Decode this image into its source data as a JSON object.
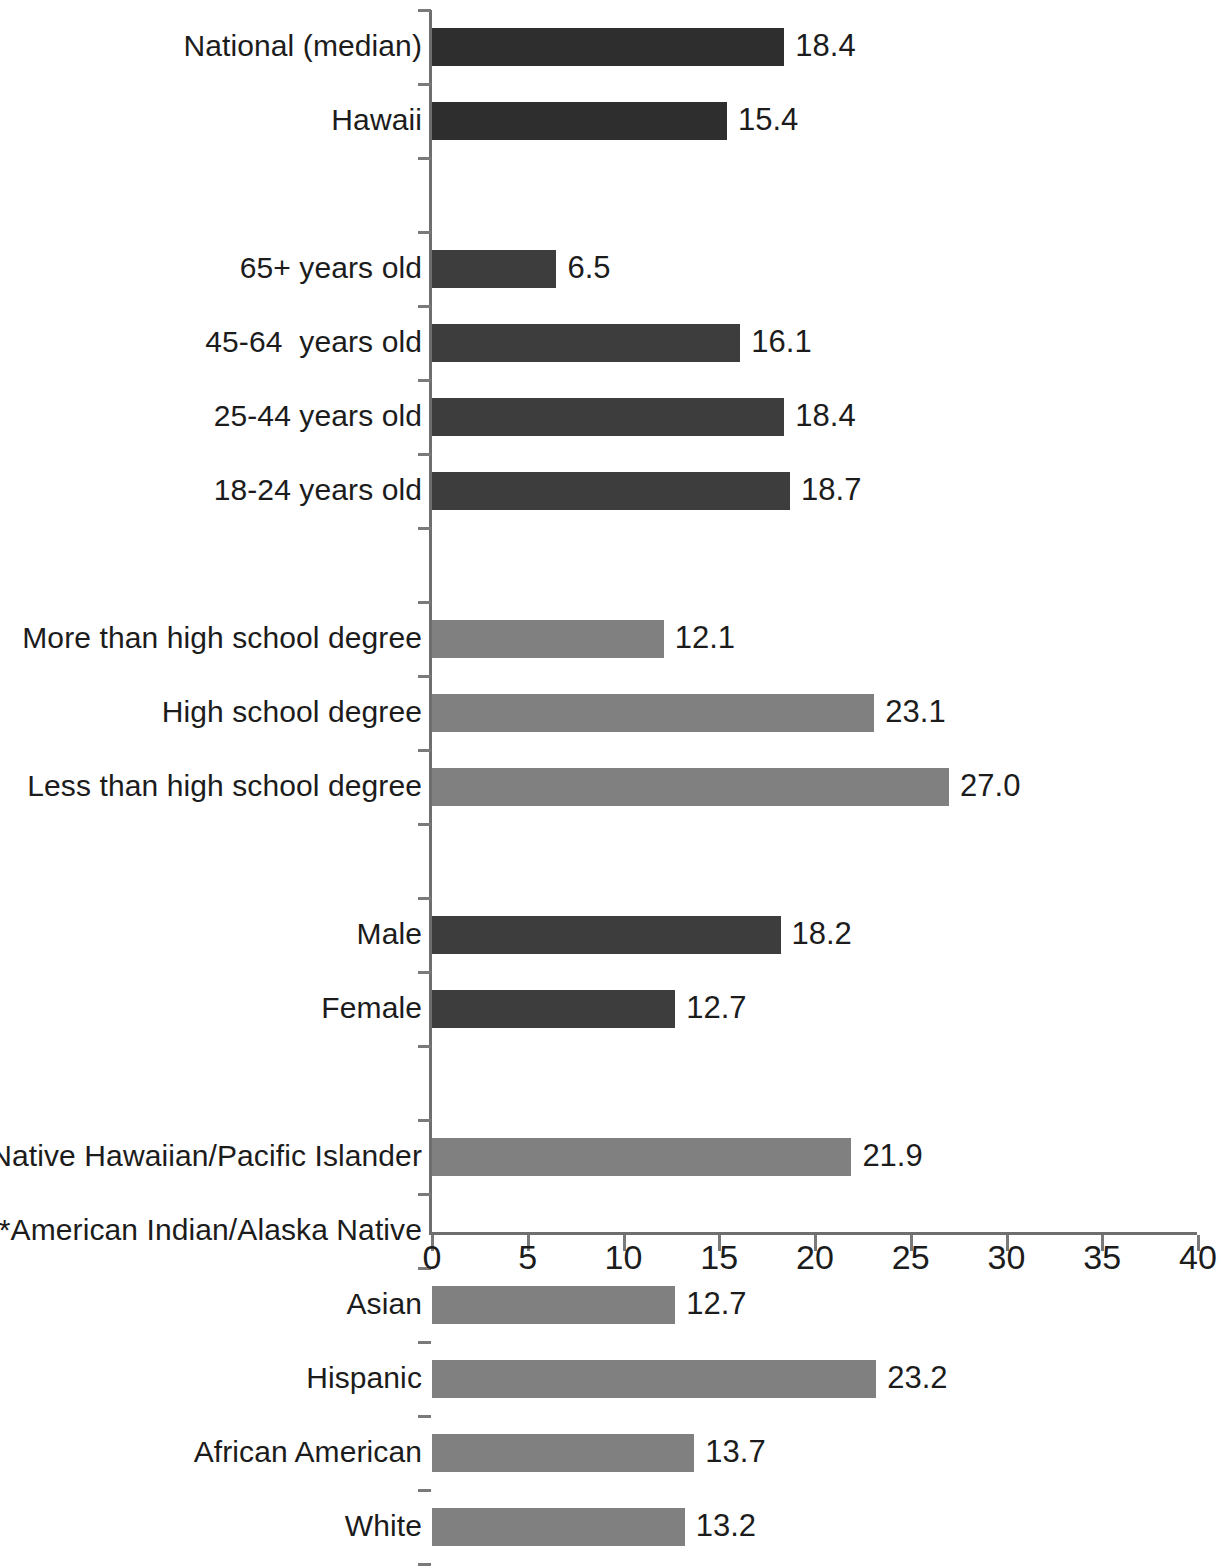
{
  "chart_data": {
    "type": "bar",
    "orientation": "horizontal",
    "title": "",
    "subtitle": "",
    "xlabel": "",
    "ylabel": "",
    "xlim": [
      0,
      40
    ],
    "xticks": [
      "0",
      "5",
      "10",
      "15",
      "20",
      "25",
      "30",
      "35",
      "40"
    ],
    "xtick_values": [
      0,
      5,
      10,
      15,
      20,
      25,
      30,
      35,
      40
    ],
    "grid": false,
    "legend": "none",
    "colors": {
      "benchmark": "#2e2e2e",
      "age": "#3d3d3d",
      "education": "#808080",
      "gender": "#3d3d3d",
      "race": "#808080",
      "axis": "#6e6e6e",
      "text": "#1c1c1c",
      "background": "#ffffff"
    },
    "note": "***American Indian/Alaska Native has no bar and no value shown",
    "categories": [
      "National (median)",
      "Hawaii",
      "",
      "65+ years old",
      "45-64  years old",
      "25-44 years old",
      "18-24 years old",
      "",
      "More than high school degree",
      "High school degree",
      "Less than high school degree",
      "",
      "Male",
      "Female",
      "",
      "Native Hawaiian/Pacific Islander",
      "***American Indian/Alaska Native",
      "Asian",
      "Hispanic",
      "African American",
      "White"
    ],
    "values": [
      18.4,
      15.4,
      null,
      6.5,
      16.1,
      18.4,
      18.7,
      null,
      12.1,
      23.1,
      27.0,
      null,
      18.2,
      12.7,
      null,
      21.9,
      null,
      12.7,
      23.2,
      13.7,
      13.2
    ],
    "rows": [
      {
        "label": "National (median)",
        "value": 18.4,
        "value_text": "18.4",
        "group": "benchmark",
        "spacer_after": false
      },
      {
        "label": "Hawaii",
        "value": 15.4,
        "value_text": "15.4",
        "group": "benchmark",
        "spacer_after": true
      },
      {
        "label": "65+ years old",
        "value": 6.5,
        "value_text": "6.5",
        "group": "age",
        "spacer_after": false
      },
      {
        "label": "45-64  years old",
        "value": 16.1,
        "value_text": "16.1",
        "group": "age",
        "spacer_after": false
      },
      {
        "label": "25-44 years old",
        "value": 18.4,
        "value_text": "18.4",
        "group": "age",
        "spacer_after": false
      },
      {
        "label": "18-24 years old",
        "value": 18.7,
        "value_text": "18.7",
        "group": "age",
        "spacer_after": true
      },
      {
        "label": "More than high school degree",
        "value": 12.1,
        "value_text": "12.1",
        "group": "education",
        "spacer_after": false
      },
      {
        "label": "High school degree",
        "value": 23.1,
        "value_text": "23.1",
        "group": "education",
        "spacer_after": false
      },
      {
        "label": "Less than high school degree",
        "value": 27.0,
        "value_text": "27.0",
        "group": "education",
        "spacer_after": true
      },
      {
        "label": "Male",
        "value": 18.2,
        "value_text": "18.2",
        "group": "gender",
        "spacer_after": false
      },
      {
        "label": "Female",
        "value": 12.7,
        "value_text": "12.7",
        "group": "gender",
        "spacer_after": true
      },
      {
        "label": "Native Hawaiian/Pacific Islander",
        "value": 21.9,
        "value_text": "21.9",
        "group": "race",
        "spacer_after": false
      },
      {
        "label": "***American Indian/Alaska Native",
        "value": null,
        "value_text": "",
        "group": "race",
        "spacer_after": false
      },
      {
        "label": "Asian",
        "value": 12.7,
        "value_text": "12.7",
        "group": "race",
        "spacer_after": false
      },
      {
        "label": "Hispanic",
        "value": 23.2,
        "value_text": "23.2",
        "group": "race",
        "spacer_after": false
      },
      {
        "label": "African American",
        "value": 13.7,
        "value_text": "13.7",
        "group": "race",
        "spacer_after": false
      },
      {
        "label": "White",
        "value": 13.2,
        "value_text": "13.2",
        "group": "race",
        "spacer_after": false
      }
    ]
  }
}
